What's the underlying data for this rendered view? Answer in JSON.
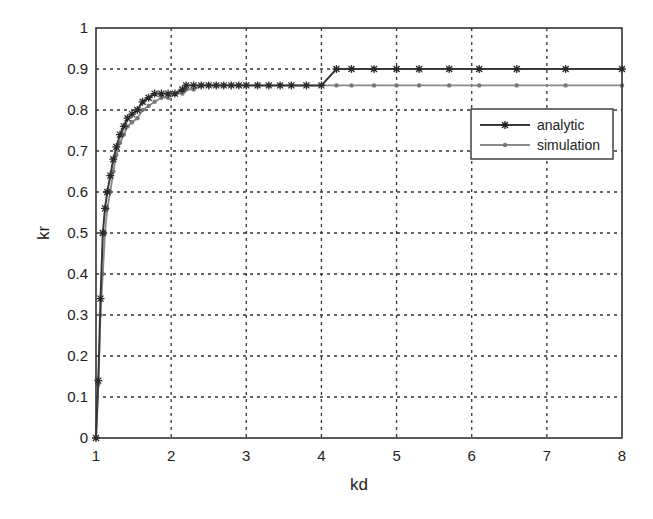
{
  "chart_data": {
    "type": "line",
    "title": "",
    "xlabel": "kd",
    "ylabel": "kr",
    "xlim": [
      1,
      8
    ],
    "ylim": [
      0,
      1
    ],
    "xticks": [
      1,
      2,
      3,
      4,
      5,
      6,
      7,
      8
    ],
    "yticks": [
      0,
      0.1,
      0.2,
      0.3,
      0.4,
      0.5,
      0.6,
      0.7,
      0.8,
      0.9,
      1
    ],
    "xtick_labels": [
      "1",
      "2",
      "3",
      "4",
      "5",
      "6",
      "7",
      "8"
    ],
    "ytick_labels": [
      "0",
      "0.1",
      "0.2",
      "0.3",
      "0.4",
      "0.5",
      "0.6",
      "0.7",
      "0.8",
      "0.9",
      "1"
    ],
    "grid": true,
    "legend_position": "upper right (inside, just below top series)",
    "series": [
      {
        "name": "analytic",
        "color": "#3a3a3a",
        "marker": "*",
        "x": [
          1.0,
          1.03,
          1.06,
          1.09,
          1.12,
          1.15,
          1.19,
          1.23,
          1.27,
          1.32,
          1.37,
          1.42,
          1.48,
          1.55,
          1.62,
          1.7,
          1.78,
          1.87,
          1.96,
          2.05,
          2.15,
          2.2,
          2.3,
          2.4,
          2.5,
          2.6,
          2.7,
          2.8,
          2.9,
          3.0,
          3.15,
          3.3,
          3.45,
          3.6,
          3.8,
          4.0,
          4.2,
          4.4,
          4.7,
          5.0,
          5.3,
          5.7,
          6.1,
          6.6,
          7.25,
          8.0
        ],
        "y": [
          0.0,
          0.14,
          0.34,
          0.5,
          0.56,
          0.6,
          0.64,
          0.68,
          0.71,
          0.74,
          0.76,
          0.78,
          0.79,
          0.8,
          0.82,
          0.83,
          0.84,
          0.84,
          0.84,
          0.84,
          0.85,
          0.86,
          0.86,
          0.86,
          0.86,
          0.86,
          0.86,
          0.86,
          0.86,
          0.86,
          0.86,
          0.86,
          0.86,
          0.86,
          0.86,
          0.86,
          0.9,
          0.9,
          0.9,
          0.9,
          0.9,
          0.9,
          0.9,
          0.9,
          0.9,
          0.9
        ]
      },
      {
        "name": "simulation",
        "color": "#8a8a8a",
        "marker": ".",
        "x": [
          1.0,
          1.03,
          1.06,
          1.09,
          1.12,
          1.15,
          1.19,
          1.23,
          1.27,
          1.32,
          1.37,
          1.42,
          1.48,
          1.55,
          1.62,
          1.7,
          1.78,
          1.87,
          1.96,
          2.05,
          2.15,
          2.2,
          2.3,
          2.4,
          2.5,
          2.6,
          2.7,
          2.8,
          2.9,
          3.0,
          3.15,
          3.3,
          3.45,
          3.6,
          3.8,
          4.0,
          4.2,
          4.4,
          4.7,
          5.0,
          5.3,
          5.7,
          6.1,
          6.6,
          7.25,
          8.0
        ],
        "y": [
          0.0,
          0.13,
          0.3,
          0.4,
          0.5,
          0.56,
          0.6,
          0.65,
          0.69,
          0.72,
          0.74,
          0.76,
          0.77,
          0.78,
          0.8,
          0.81,
          0.82,
          0.83,
          0.83,
          0.84,
          0.84,
          0.85,
          0.85,
          0.86,
          0.86,
          0.86,
          0.86,
          0.86,
          0.86,
          0.86,
          0.86,
          0.86,
          0.86,
          0.86,
          0.86,
          0.86,
          0.86,
          0.86,
          0.86,
          0.86,
          0.86,
          0.86,
          0.86,
          0.86,
          0.86,
          0.86
        ]
      }
    ]
  },
  "legend": {
    "items": [
      {
        "label": "analytic"
      },
      {
        "label": "simulation"
      }
    ]
  },
  "axes": {
    "xlabel": "kd",
    "ylabel": "kr"
  }
}
